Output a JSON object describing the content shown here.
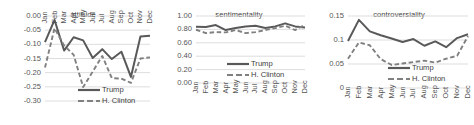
{
  "figure": {
    "series_names": [
      "Trump",
      "H. Clinton"
    ],
    "months": [
      "Jan",
      "Feb",
      "Mar",
      "Apr",
      "May",
      "Jun",
      "Jul",
      "Aug",
      "Sep",
      "Oct",
      "Nov",
      "Dec"
    ],
    "colors": {
      "trump": "#595959",
      "clinton": "#808080",
      "grid": "#d9d9d9",
      "text": "#555555"
    }
  },
  "legend": {
    "trump_label": "Trump",
    "clinton_label": "H. Clinton"
  },
  "chart_data": [
    {
      "type": "line",
      "title": "attitude",
      "xlabel": "",
      "ylabel": "",
      "categories": [
        "Jan",
        "Feb",
        "Mar",
        "Apr",
        "May",
        "Jun",
        "Jul",
        "Aug",
        "Sep",
        "Oct",
        "Nov",
        "Dec"
      ],
      "ytick_labels": [
        "0.00",
        "-0.05",
        "-0.10",
        "-0.15",
        "-0.20",
        "-0.25",
        "-0.30"
      ],
      "ytick_values": [
        0.0,
        -0.05,
        -0.1,
        -0.15,
        -0.2,
        -0.25,
        -0.3
      ],
      "ylim": [
        -0.3,
        0.0
      ],
      "grid": true,
      "legend_position": "bottom-right",
      "series": [
        {
          "name": "Trump",
          "values": [
            -0.092,
            -0.014,
            -0.122,
            -0.075,
            -0.086,
            -0.148,
            -0.117,
            -0.152,
            -0.126,
            -0.215,
            -0.072,
            -0.07
          ]
        },
        {
          "name": "H. Clinton",
          "values": [
            -0.182,
            -0.043,
            -0.104,
            -0.137,
            -0.251,
            -0.196,
            -0.141,
            -0.219,
            -0.221,
            -0.236,
            -0.15,
            -0.146
          ]
        }
      ]
    },
    {
      "type": "line",
      "title": "sentimentality",
      "xlabel": "",
      "ylabel": "",
      "categories": [
        "Jan",
        "Feb",
        "Mar",
        "Apr",
        "May",
        "Jun",
        "Jul",
        "Aug",
        "Sep",
        "Oct",
        "Nov",
        "Dec"
      ],
      "ytick_labels": [
        "1.00",
        "0.80",
        "0.60",
        "0.40",
        "0.20",
        "0.00"
      ],
      "ytick_values": [
        1.0,
        0.8,
        0.6,
        0.4,
        0.2,
        0.0
      ],
      "ylim": [
        0.0,
        1.0
      ],
      "grid": true,
      "legend_position": "bottom-right",
      "series": [
        {
          "name": "Trump",
          "values": [
            0.84,
            0.835,
            0.865,
            0.79,
            0.82,
            0.845,
            0.855,
            0.82,
            0.845,
            0.89,
            0.845,
            0.83
          ]
        },
        {
          "name": "H. Clinton",
          "values": [
            0.795,
            0.745,
            0.76,
            0.755,
            0.79,
            0.745,
            0.76,
            0.79,
            0.82,
            0.855,
            0.79,
            0.87
          ]
        }
      ]
    },
    {
      "type": "line",
      "title": "controversiality",
      "xlabel": "",
      "ylabel": "",
      "categories": [
        "Jan",
        "Feb",
        "Mar",
        "Apr",
        "May",
        "Jun",
        "Jul",
        "Aug",
        "Sep",
        "Oct",
        "Nov",
        "Dec"
      ],
      "ytick_labels": [
        "0.15",
        "0.1",
        "0.05",
        "0"
      ],
      "ytick_values": [
        0.15,
        0.1,
        0.05,
        0.0
      ],
      "ylim": [
        0.0,
        0.15
      ],
      "grid": true,
      "legend_position": "bottom-right",
      "series": [
        {
          "name": "Trump",
          "values": [
            0.098,
            0.142,
            0.118,
            0.11,
            0.103,
            0.096,
            0.102,
            0.088,
            0.097,
            0.085,
            0.104,
            0.112
          ]
        },
        {
          "name": "H. Clinton",
          "values": [
            0.061,
            0.095,
            0.089,
            0.06,
            0.048,
            0.051,
            0.054,
            0.057,
            0.053,
            0.061,
            0.067,
            0.108
          ]
        }
      ]
    }
  ]
}
